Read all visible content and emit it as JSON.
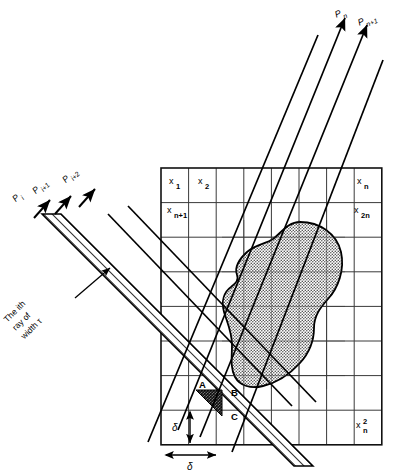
{
  "figure": {
    "type": "technical-line-diagram"
  },
  "grid": {
    "rows": 8,
    "cols": 8,
    "x0": 161,
    "y0": 168,
    "cell": 27.6,
    "line_color": "#3a3a3a",
    "border_color": "#111111",
    "labels": [
      {
        "id": "cell-x1",
        "base": "x",
        "sup": "",
        "sub": "1",
        "x": 170,
        "y": 186
      },
      {
        "id": "cell-x2",
        "base": "x",
        "sup": "",
        "sub": "2",
        "x": 199,
        "y": 186
      },
      {
        "id": "cell-xn",
        "base": "x",
        "sup": "",
        "sub": "n",
        "x": 358,
        "y": 186
      },
      {
        "id": "cell-xn1",
        "base": "x",
        "sup": "",
        "sub": "n+1",
        "x": 168,
        "y": 215
      },
      {
        "id": "cell-x2n",
        "base": "x",
        "sup": "",
        "sub": "2n",
        "x": 355,
        "y": 215
      },
      {
        "id": "cell-xn2",
        "base": "x",
        "sup": "2",
        "sub": "n",
        "x": 357,
        "y": 430
      }
    ]
  },
  "rays_top_right": {
    "color": "#000000",
    "labels": [
      {
        "id": "ray-Pn",
        "base": "P",
        "sub": "n",
        "x": 341,
        "y": 16
      },
      {
        "id": "ray-Pn1",
        "base": "P",
        "sub": "n+1",
        "x": 364,
        "y": 24
      }
    ]
  },
  "rays_top_left": {
    "color": "#000000",
    "labels": [
      {
        "id": "ray-Pi",
        "base": "P",
        "sub": "i",
        "x": 15,
        "y": 196
      },
      {
        "id": "ray-Pi1",
        "base": "P",
        "sub": "i+1",
        "x": 34,
        "y": 188
      },
      {
        "id": "ray-Pi2",
        "base": "P",
        "sub": "i+2",
        "x": 66,
        "y": 177
      }
    ]
  },
  "ray_band": {
    "name": "hatched-ray-band",
    "note_lines": [
      "The ith",
      "ray of",
      "width τ"
    ],
    "note_x": 28,
    "note_y": 300,
    "note_rotation": -45
  },
  "detail_labels": [
    {
      "id": "label-A",
      "text": "A",
      "x": 199,
      "y": 388
    },
    {
      "id": "label-B",
      "text": "B",
      "x": 231,
      "y": 396
    },
    {
      "id": "label-C",
      "text": "C",
      "x": 231,
      "y": 420
    }
  ],
  "delta_markers": [
    {
      "id": "delta-vertical",
      "text": "δ",
      "x": 174,
      "y": 426
    },
    {
      "id": "delta-horizontal",
      "text": "δ",
      "x": 210,
      "y": 465
    }
  ],
  "colors": {
    "blob_fill": "#c9c9c9",
    "blob_stroke": "#000000",
    "dark_overlap": "#4a4a4a",
    "hatch_stroke": "#000000",
    "grid": "#3a3a3a"
  }
}
